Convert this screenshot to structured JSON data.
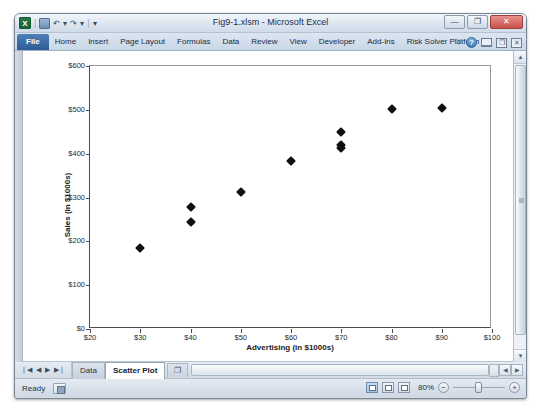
{
  "window": {
    "title": "Fig9-1.xlsm - Microsoft Excel",
    "logo_text": "X",
    "qat": {
      "save_label": "save-icon",
      "undo_label": "↶",
      "undo_caret": "▾",
      "redo_label": "↷",
      "redo_caret": "▾",
      "sep": "|",
      "customize_caret": "▾"
    },
    "buttons": {
      "minimize": "—",
      "maximize": "❐",
      "close": "✕"
    }
  },
  "ribbon": {
    "tabs": [
      {
        "label": "File"
      },
      {
        "label": "Home"
      },
      {
        "label": "Insert"
      },
      {
        "label": "Page Layout"
      },
      {
        "label": "Formulas"
      },
      {
        "label": "Data"
      },
      {
        "label": "Review"
      },
      {
        "label": "View"
      },
      {
        "label": "Developer"
      },
      {
        "label": "Add-Ins"
      },
      {
        "label": "Risk Solver Platform"
      }
    ],
    "right_controls": {
      "collapse_caret": "♡",
      "help": "?",
      "minimize_ribbon": "",
      "restore_window": "❐",
      "close_window": "✕"
    }
  },
  "scrollbars": {
    "v_up": "▲",
    "v_down": "▼",
    "h_left": "◀",
    "h_right": "▶"
  },
  "sheet_tabs": {
    "nav": {
      "first": "❘◀",
      "prev": "◀",
      "next": "▶",
      "last": "▶❘"
    },
    "tabs": [
      {
        "label": "Data",
        "active": false
      },
      {
        "label": "Scatter Plot",
        "active": true
      }
    ],
    "new_sheet_label": "❐"
  },
  "status": {
    "text": "Ready",
    "macro_record": "macro-record-icon",
    "views": [
      "normal-view",
      "page-layout-view",
      "page-break-view"
    ],
    "zoom": "80%",
    "zoom_out": "−",
    "zoom_in": "+"
  },
  "chart_data": {
    "type": "scatter",
    "title": "",
    "xlabel": "Advertising (in $1000s)",
    "ylabel": "Sales (in $1000s)",
    "xlim": [
      20,
      100
    ],
    "ylim": [
      0,
      600
    ],
    "xticks": [
      20,
      30,
      40,
      50,
      60,
      70,
      80,
      90,
      100
    ],
    "xtick_labels": [
      "$20",
      "$30",
      "$40",
      "$50",
      "$60",
      "$70",
      "$80",
      "$90",
      "$100"
    ],
    "yticks": [
      0,
      100,
      200,
      300,
      400,
      500,
      600
    ],
    "ytick_labels": [
      "$0",
      "$100",
      "$200",
      "$300",
      "$400",
      "$500",
      "$600"
    ],
    "grid": false,
    "legend": false,
    "marker": "diamond",
    "marker_color": "#101010",
    "points": [
      {
        "x": 30,
        "y": 185
      },
      {
        "x": 40,
        "y": 278
      },
      {
        "x": 40,
        "y": 243
      },
      {
        "x": 50,
        "y": 313
      },
      {
        "x": 60,
        "y": 383
      },
      {
        "x": 70,
        "y": 450
      },
      {
        "x": 70,
        "y": 420
      },
      {
        "x": 70,
        "y": 412
      },
      {
        "x": 80,
        "y": 502
      },
      {
        "x": 90,
        "y": 505
      }
    ]
  }
}
